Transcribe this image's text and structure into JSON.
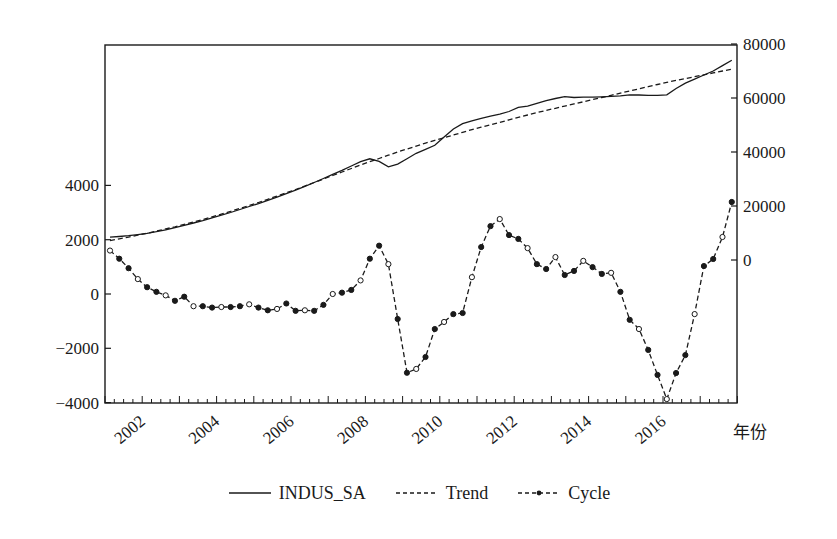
{
  "chart_data": {
    "type": "line",
    "title": "",
    "xlabel": "年份",
    "ylabel_left": "",
    "ylabel_right": "",
    "x_tick_labels": [
      "2002",
      "2004",
      "2006",
      "2008",
      "2010",
      "2012",
      "2014",
      "2016"
    ],
    "x_range": [
      "2001Q1",
      "2017Q4"
    ],
    "left_axis": {
      "ticks": [
        4000,
        2000,
        0,
        -2000,
        -4000
      ],
      "ylim": [
        -4000,
        6600
      ]
    },
    "right_axis": {
      "ticks": [
        80000,
        60000,
        40000,
        20000,
        0
      ],
      "ylim": [
        -52500,
        80000
      ]
    },
    "grid": false,
    "legend_position": "bottom",
    "legend": [
      "INDUS_SA",
      "Trend",
      "Cycle"
    ],
    "series": [
      {
        "name": "INDUS_SA",
        "axis": "right",
        "style": "solid",
        "x_start": "2001Q1",
        "frequency": "quarterly",
        "values": [
          8500,
          8700,
          9000,
          9400,
          9900,
          10500,
          11200,
          12000,
          12800,
          13700,
          14600,
          15600,
          16600,
          17600,
          18700,
          19800,
          20900,
          22100,
          23300,
          24600,
          25900,
          27300,
          28700,
          30200,
          31700,
          33200,
          34800,
          36400,
          37500,
          36500,
          34500,
          35500,
          37500,
          39500,
          41000,
          42500,
          45500,
          48500,
          50500,
          51500,
          52500,
          53300,
          54000,
          55000,
          56500,
          57000,
          58000,
          59000,
          59800,
          60500,
          60200,
          60300,
          60300,
          60400,
          60600,
          60800,
          61200,
          61100,
          61000,
          61000,
          61200,
          63500,
          65500,
          67000,
          68500,
          70000,
          72000,
          74000
        ]
      },
      {
        "name": "Trend",
        "axis": "right",
        "style": "dashed",
        "x_start": "2001Q1",
        "frequency": "quarterly",
        "values": [
          7200,
          7800,
          8500,
          9200,
          9900,
          10700,
          11500,
          12300,
          13200,
          14100,
          15000,
          16000,
          17000,
          18000,
          19100,
          20200,
          21300,
          22500,
          23700,
          24900,
          26100,
          27400,
          28700,
          30000,
          31300,
          32600,
          33900,
          35200,
          36400,
          37600,
          38800,
          40000,
          41100,
          42200,
          43300,
          44300,
          45300,
          46300,
          47300,
          48300,
          49200,
          50100,
          51000,
          51900,
          52800,
          53700,
          54600,
          55400,
          56200,
          57000,
          57800,
          58600,
          59400,
          60200,
          61000,
          61800,
          62600,
          63400,
          64200,
          65000,
          65800,
          66500,
          67200,
          67900,
          68600,
          69300,
          70000,
          70700
        ]
      },
      {
        "name": "Cycle",
        "axis": "left",
        "style": "dashed-markers",
        "x_start": "2001Q1",
        "frequency": "quarterly",
        "values": [
          1600,
          1300,
          950,
          550,
          250,
          80,
          -50,
          -250,
          -100,
          -450,
          -450,
          -500,
          -480,
          -480,
          -450,
          -380,
          -500,
          -600,
          -550,
          -350,
          -620,
          -600,
          -620,
          -400,
          0,
          50,
          150,
          500,
          1300,
          1780,
          1100,
          -920,
          -2900,
          -2760,
          -2320,
          -1290,
          -1030,
          -740,
          -700,
          620,
          1730,
          2500,
          2760,
          2170,
          2030,
          1690,
          1100,
          920,
          1360,
          700,
          850,
          1220,
          990,
          740,
          780,
          80,
          -950,
          -1290,
          -2060,
          -2980,
          -3870,
          -2910,
          -2250,
          -740,
          1030,
          1290,
          2100,
          3390
        ]
      }
    ]
  },
  "legend": {
    "items": [
      {
        "label": "INDUS_SA"
      },
      {
        "label": "Trend"
      },
      {
        "label": "Cycle"
      }
    ]
  },
  "colors": {
    "ink": "#1a1a1a",
    "background": "#ffffff"
  }
}
